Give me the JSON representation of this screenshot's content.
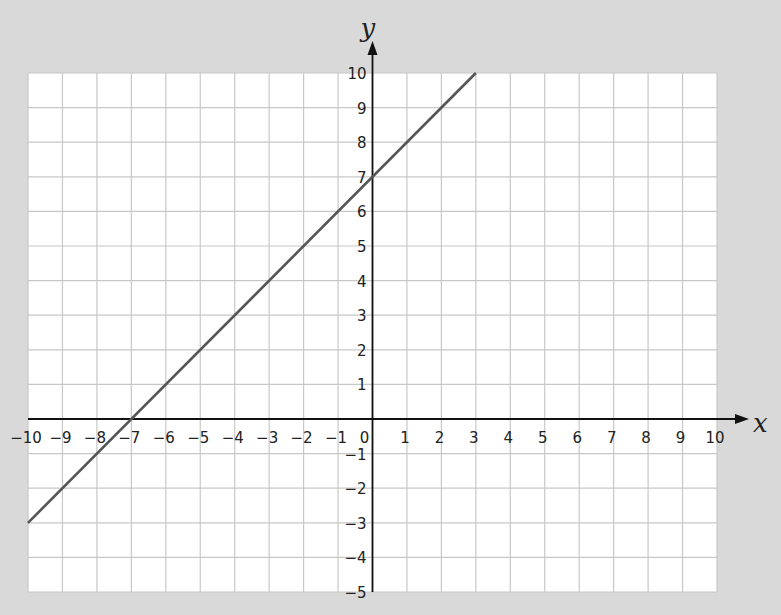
{
  "chart_data": {
    "type": "line",
    "title": "",
    "xlabel": "x",
    "ylabel": "y",
    "xlim": [
      -10,
      10
    ],
    "ylim": [
      -5,
      10
    ],
    "grid": true,
    "x_ticks": [
      -10,
      -9,
      -8,
      -7,
      -6,
      -5,
      -4,
      -3,
      -2,
      -1,
      0,
      1,
      2,
      3,
      4,
      5,
      6,
      7,
      8,
      9,
      10
    ],
    "y_ticks": [
      -5,
      -4,
      -3,
      -2,
      -1,
      1,
      2,
      3,
      4,
      5,
      6,
      7,
      8,
      9,
      10
    ],
    "series": [
      {
        "name": "y = x + 7",
        "x": [
          -10,
          3
        ],
        "y": [
          -3,
          10
        ],
        "color": "#555555"
      }
    ],
    "intercepts": {
      "x_intercept": -7,
      "y_intercept": 7
    }
  },
  "colors": {
    "background": "#d9d9d9",
    "plot_area": "#ffffff",
    "grid": "#c8c8c8",
    "axis": "#111111",
    "line": "#555555"
  }
}
